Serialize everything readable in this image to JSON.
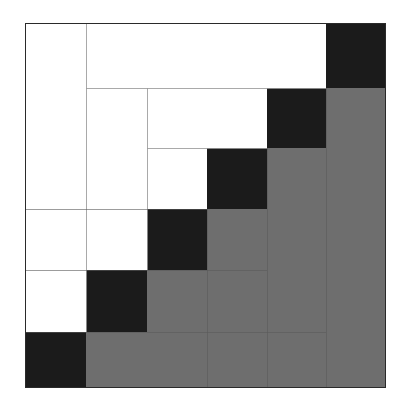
{
  "figure": {
    "title": "",
    "caption": "",
    "background_color": "#ffffff"
  },
  "chart_data": {
    "type": "heatmap",
    "title": "",
    "subtitle": "",
    "xlabel": "",
    "ylabel": "",
    "grid": true,
    "legend_position": "none",
    "n_rows": 6,
    "n_cols": 6,
    "row_labels": [
      "1",
      "2",
      "3",
      "4",
      "5",
      "6"
    ],
    "col_labels": [
      "1",
      "2",
      "3",
      "4",
      "5",
      "6"
    ],
    "row_boundaries_px": [
      23,
      88,
      148,
      209,
      270,
      332,
      388
    ],
    "col_boundaries_px": [
      25,
      86,
      147,
      207,
      267,
      326,
      386
    ],
    "value_legend": {
      "white": 0,
      "dark": 2,
      "gray": 1
    },
    "colors": {
      "white": "#ffffff",
      "dark": "#1b1b1b",
      "gray": "#6e6e6e",
      "gridline": "#9a9a9a",
      "border": "#2a2a2a"
    },
    "matrix": [
      [
        0,
        0,
        0,
        0,
        0,
        2
      ],
      [
        0,
        0,
        0,
        0,
        2,
        1
      ],
      [
        0,
        0,
        0,
        2,
        1,
        1
      ],
      [
        0,
        0,
        2,
        1,
        1,
        1
      ],
      [
        0,
        2,
        1,
        1,
        1,
        1
      ],
      [
        2,
        1,
        1,
        1,
        1,
        1
      ]
    ]
  }
}
